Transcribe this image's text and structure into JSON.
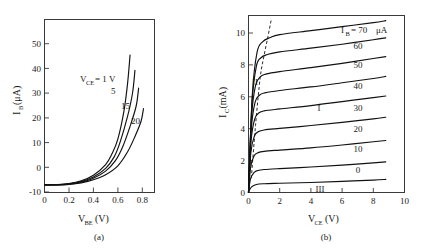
{
  "figure": {
    "title": "",
    "panels": [
      {
        "caption": "(a)",
        "xlabel_main": "V",
        "xlabel_sub": "BE",
        "xlabel_unit": "(V)",
        "ylabel_main": "I",
        "ylabel_sub": "B",
        "ylabel_unit": "(μA)"
      },
      {
        "caption": "(b)",
        "xlabel_main": "V",
        "xlabel_sub": "CE",
        "xlabel_unit": "(V)",
        "ylabel_main": "I",
        "ylabel_sub": "C",
        "ylabel_unit": "(mA)"
      }
    ]
  },
  "chart_data": [
    {
      "type": "line",
      "title": "(a)",
      "xlabel": "V_BE (V)",
      "ylabel": "I_B (μA)",
      "xlim": [
        0,
        0.9
      ],
      "ylim": [
        -10,
        58
      ],
      "xticks": [
        "0",
        "0.2",
        "0.4",
        "0.6",
        "0.8"
      ],
      "xtickvals": [
        0,
        0.2,
        0.4,
        0.6,
        0.8
      ],
      "yticks": [
        "-10",
        "0",
        "10",
        "20",
        "30",
        "40",
        "50"
      ],
      "ytickvals": [
        -10,
        0,
        10,
        20,
        30,
        40,
        50
      ],
      "grid": false,
      "legend_position": "inline-curve-labels",
      "series": [
        {
          "name": "V_CE = 1 V",
          "label": "1 V",
          "label_prefix": "V",
          "label_sub": "CE",
          "label_eq": "= 1 V",
          "points": [
            [
              0,
              -7
            ],
            [
              0.1,
              -6.9
            ],
            [
              0.2,
              -6.5
            ],
            [
              0.3,
              -5.4
            ],
            [
              0.4,
              -3.2
            ],
            [
              0.5,
              1.0
            ],
            [
              0.55,
              5
            ],
            [
              0.6,
              11
            ],
            [
              0.65,
              22
            ],
            [
              0.68,
              33
            ],
            [
              0.7,
              44
            ]
          ]
        },
        {
          "name": "V_CE = 5 V",
          "label": "5",
          "points": [
            [
              0,
              -7
            ],
            [
              0.1,
              -6.95
            ],
            [
              0.2,
              -6.6
            ],
            [
              0.3,
              -5.7
            ],
            [
              0.4,
              -3.9
            ],
            [
              0.5,
              -0.5
            ],
            [
              0.57,
              4
            ],
            [
              0.62,
              10
            ],
            [
              0.68,
              20
            ],
            [
              0.72,
              29
            ],
            [
              0.74,
              38
            ]
          ]
        },
        {
          "name": "V_CE = 15 V",
          "label": "15",
          "points": [
            [
              0,
              -7
            ],
            [
              0.1,
              -7.0
            ],
            [
              0.2,
              -6.7
            ],
            [
              0.3,
              -5.9
            ],
            [
              0.4,
              -4.4
            ],
            [
              0.5,
              -1.6
            ],
            [
              0.58,
              2.5
            ],
            [
              0.64,
              8
            ],
            [
              0.7,
              16
            ],
            [
              0.75,
              24
            ],
            [
              0.77,
              31
            ]
          ]
        },
        {
          "name": "V_CE = 20 V",
          "label": "20",
          "points": [
            [
              0,
              -7
            ],
            [
              0.1,
              -7.0
            ],
            [
              0.2,
              -6.8
            ],
            [
              0.3,
              -6.2
            ],
            [
              0.4,
              -5.0
            ],
            [
              0.5,
              -3.0
            ],
            [
              0.6,
              0.5
            ],
            [
              0.68,
              6
            ],
            [
              0.74,
              12
            ],
            [
              0.79,
              18
            ],
            [
              0.81,
              23
            ]
          ]
        }
      ]
    },
    {
      "type": "line",
      "title": "(b)",
      "xlabel": "V_CE (V)",
      "ylabel": "I_C (mA)",
      "xlim": [
        0,
        10
      ],
      "ylim": [
        0,
        11.1
      ],
      "xticks": [
        "0",
        "2",
        "4",
        "6",
        "8",
        "10"
      ],
      "xtickvals": [
        0,
        2,
        4,
        6,
        8,
        10
      ],
      "yticks": [
        "0",
        "2",
        "4",
        "6",
        "8",
        "10"
      ],
      "ytickvals": [
        0,
        2,
        4,
        6,
        8,
        10
      ],
      "grid": false,
      "legend_position": "inline-curve-labels",
      "annotations": [
        {
          "text": "I",
          "role": "active-region-marker",
          "x": 4.55,
          "y": 5.1
        },
        {
          "text": "II",
          "role": "saturation-region-marker",
          "x": 0.45,
          "y": 6.9
        },
        {
          "text": "III",
          "role": "cutoff-region-marker",
          "x": 4.6,
          "y": 0.35
        },
        {
          "text": "saturation-boundary",
          "role": "dashed-load-boundary"
        }
      ],
      "series_label_header": {
        "main": "I",
        "sub": "B",
        "eq": "= 70",
        "unit": "μA"
      },
      "series": [
        {
          "name": "IB = 70 uA",
          "label": "70",
          "ib_uA": 70,
          "points": [
            [
              0,
              0
            ],
            [
              0.25,
              6.2
            ],
            [
              0.55,
              8.8
            ],
            [
              0.9,
              9.45
            ],
            [
              1.4,
              9.72
            ],
            [
              2,
              9.9
            ],
            [
              4,
              10.15
            ],
            [
              6,
              10.4
            ],
            [
              8,
              10.65
            ],
            [
              8.8,
              10.78
            ]
          ]
        },
        {
          "name": "IB = 60 uA",
          "label": "60",
          "ib_uA": 60,
          "points": [
            [
              0,
              0
            ],
            [
              0.22,
              5.6
            ],
            [
              0.5,
              7.9
            ],
            [
              0.8,
              8.45
            ],
            [
              1.2,
              8.65
            ],
            [
              2,
              8.82
            ],
            [
              4,
              9.05
            ],
            [
              6,
              9.3
            ],
            [
              8,
              9.58
            ],
            [
              8.8,
              9.7
            ]
          ]
        },
        {
          "name": "IB = 50 uA",
          "label": "50",
          "ib_uA": 50,
          "points": [
            [
              0,
              0
            ],
            [
              0.2,
              4.8
            ],
            [
              0.45,
              6.7
            ],
            [
              0.75,
              7.25
            ],
            [
              1.1,
              7.42
            ],
            [
              2,
              7.58
            ],
            [
              4,
              7.83
            ],
            [
              6,
              8.1
            ],
            [
              8,
              8.4
            ],
            [
              8.8,
              8.52
            ]
          ]
        },
        {
          "name": "IB = 40 uA",
          "label": "40",
          "ib_uA": 40,
          "points": [
            [
              0,
              0
            ],
            [
              0.18,
              4.0
            ],
            [
              0.42,
              5.65
            ],
            [
              0.7,
              6.1
            ],
            [
              1.05,
              6.25
            ],
            [
              2,
              6.4
            ],
            [
              4,
              6.62
            ],
            [
              6,
              6.88
            ],
            [
              8,
              7.15
            ],
            [
              8.8,
              7.28
            ]
          ]
        },
        {
          "name": "IB = 30 uA",
          "label": "30",
          "ib_uA": 30,
          "points": [
            [
              0,
              0
            ],
            [
              0.16,
              3.2
            ],
            [
              0.4,
              4.62
            ],
            [
              0.68,
              5.0
            ],
            [
              1.0,
              5.12
            ],
            [
              2,
              5.24
            ],
            [
              4,
              5.45
            ],
            [
              6,
              5.7
            ],
            [
              8,
              5.95
            ],
            [
              8.8,
              6.05
            ]
          ]
        },
        {
          "name": "IB = 20 uA",
          "label": "20",
          "ib_uA": 20,
          "points": [
            [
              0,
              0
            ],
            [
              0.15,
              2.5
            ],
            [
              0.38,
              3.55
            ],
            [
              0.65,
              3.82
            ],
            [
              1.0,
              3.92
            ],
            [
              2,
              4.02
            ],
            [
              4,
              4.2
            ],
            [
              6,
              4.4
            ],
            [
              8,
              4.62
            ],
            [
              8.8,
              4.72
            ]
          ]
        },
        {
          "name": "IB = 10 uA",
          "label": "10",
          "ib_uA": 10,
          "points": [
            [
              0,
              0
            ],
            [
              0.14,
              1.6
            ],
            [
              0.36,
              2.3
            ],
            [
              0.62,
              2.5
            ],
            [
              1.0,
              2.58
            ],
            [
              2,
              2.66
            ],
            [
              4,
              2.8
            ],
            [
              6,
              2.98
            ],
            [
              8,
              3.18
            ],
            [
              8.8,
              3.26
            ]
          ]
        },
        {
          "name": "IB = 0 uA",
          "label": "0",
          "ib_uA": 0,
          "points": [
            [
              0,
              0
            ],
            [
              0.13,
              0.85
            ],
            [
              0.35,
              1.25
            ],
            [
              0.6,
              1.38
            ],
            [
              1.0,
              1.44
            ],
            [
              2,
              1.5
            ],
            [
              4,
              1.6
            ],
            [
              6,
              1.72
            ],
            [
              8,
              1.86
            ],
            [
              8.8,
              1.92
            ]
          ]
        },
        {
          "name": "IB leakage",
          "label": "",
          "ib_uA": null,
          "points": [
            [
              0,
              0.05
            ],
            [
              0.2,
              0.35
            ],
            [
              0.5,
              0.5
            ],
            [
              1.0,
              0.55
            ],
            [
              2,
              0.58
            ],
            [
              4,
              0.63
            ],
            [
              6,
              0.7
            ],
            [
              8,
              0.78
            ],
            [
              8.8,
              0.82
            ]
          ]
        }
      ],
      "dashed_boundary": [
        [
          0.18,
          0.9
        ],
        [
          0.45,
          4.2
        ],
        [
          0.75,
          7.2
        ],
        [
          1.0,
          8.6
        ],
        [
          1.25,
          9.8
        ],
        [
          1.45,
          10.8
        ]
      ]
    }
  ]
}
